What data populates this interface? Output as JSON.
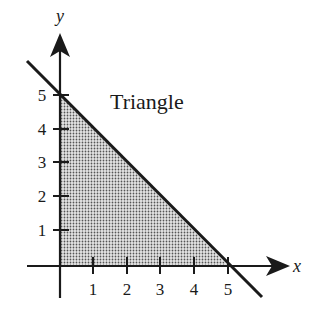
{
  "figure": {
    "region_label": "Triangle",
    "x_axis_label": "x",
    "y_axis_label": "y",
    "x_ticks": [
      "1",
      "2",
      "3",
      "4",
      "5"
    ],
    "y_ticks": [
      "1",
      "2",
      "3",
      "4",
      "5"
    ],
    "line_equation": "x + y = 5",
    "shaded_region": "triangle bounded by x-axis, y-axis, and x + y = 5",
    "colors": {
      "ink": "#1a1a1a",
      "shade_dot": "#555555",
      "background": "#ffffff"
    }
  }
}
